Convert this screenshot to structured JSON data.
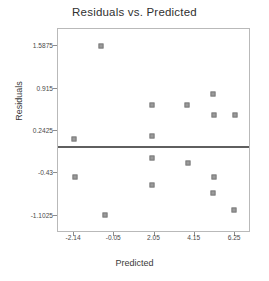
{
  "chart_data": {
    "type": "scatter",
    "title": "Residuals vs. Predicted",
    "xlabel": "Predicted",
    "ylabel": "Residuals",
    "xlim": [
      -2.98,
      7.08
    ],
    "ylim": [
      -1.38,
      1.86
    ],
    "grid": false,
    "legend": null,
    "xticks": [
      "-2.14",
      "-0.05",
      "2.05",
      "4.15",
      "6.25"
    ],
    "xtick_values": [
      -2.14,
      -0.05,
      2.05,
      4.15,
      6.25
    ],
    "yticks": [
      "1.5875",
      "0.915",
      "0.2425",
      "-0.43",
      "-1.1025"
    ],
    "ytick_values": [
      1.5875,
      0.915,
      0.2425,
      -0.43,
      -1.1025
    ],
    "reference_line": {
      "orientation": "horizontal",
      "y": 0.0,
      "color": "#5f5f5f"
    },
    "marker": {
      "shape": "square",
      "color": "#9a9a9a",
      "edge_color": "#7c7c7c",
      "size": 5
    },
    "points": [
      {
        "x": -0.72,
        "y": 1.5875
      },
      {
        "x": -2.14,
        "y": 0.108
      },
      {
        "x": 1.93,
        "y": 0.657
      },
      {
        "x": 1.93,
        "y": 0.163
      },
      {
        "x": 1.93,
        "y": -0.183
      },
      {
        "x": 1.93,
        "y": -0.613
      },
      {
        "x": -0.53,
        "y": -1.089
      },
      {
        "x": -2.09,
        "y": -0.498
      },
      {
        "x": 3.76,
        "y": 0.657
      },
      {
        "x": 3.81,
        "y": -0.262
      },
      {
        "x": 5.1,
        "y": 0.826
      },
      {
        "x": 5.15,
        "y": 0.494
      },
      {
        "x": 5.15,
        "y": -0.498
      },
      {
        "x": 5.1,
        "y": -0.745
      },
      {
        "x": 6.25,
        "y": 0.494
      },
      {
        "x": 6.2,
        "y": -1.014
      }
    ]
  },
  "series_label": "residual-point"
}
